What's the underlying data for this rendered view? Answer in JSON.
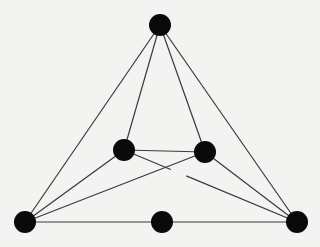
{
  "diagram": {
    "type": "graph",
    "background": "#f3f3f1",
    "edge_color": "#3a3a3a",
    "node_color": "#0a0a0a",
    "node_radius": 11,
    "nodes": [
      {
        "id": "top",
        "x": 160,
        "y": 25
      },
      {
        "id": "inner-left",
        "x": 124,
        "y": 150
      },
      {
        "id": "inner-right",
        "x": 205,
        "y": 152
      },
      {
        "id": "bottom-left",
        "x": 25,
        "y": 222
      },
      {
        "id": "bottom-middle",
        "x": 162,
        "y": 222
      },
      {
        "id": "bottom-right",
        "x": 297,
        "y": 222
      }
    ],
    "edges": [
      {
        "from": "top",
        "to": "bottom-left"
      },
      {
        "from": "top",
        "to": "inner-left"
      },
      {
        "from": "top",
        "to": "inner-right"
      },
      {
        "from": "top",
        "to": "bottom-right"
      },
      {
        "from": "inner-left",
        "to": "inner-right"
      },
      {
        "from": "inner-left",
        "to": "bottom-left"
      },
      {
        "from": "inner-right",
        "to": "bottom-left"
      },
      {
        "from": "inner-left",
        "to": "bottom-right",
        "crossing_gap": true
      },
      {
        "from": "inner-right",
        "to": "bottom-right"
      },
      {
        "from": "bottom-left",
        "to": "bottom-middle"
      },
      {
        "from": "bottom-middle",
        "to": "bottom-right"
      }
    ]
  }
}
